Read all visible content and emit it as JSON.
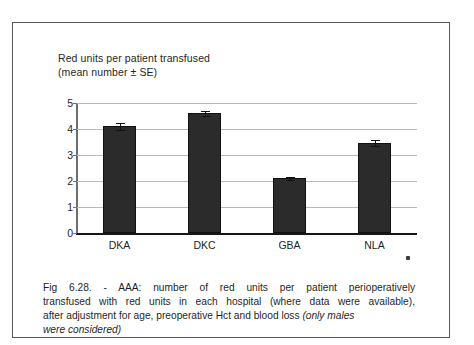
{
  "figure": {
    "title_lines": [
      "Red units per patient transfused",
      "(mean number ± SE)"
    ],
    "caption": {
      "line1": "Fig 6.28. - AAA: number of red units per patient perioperatively",
      "line2": "transfused with red units in each hospital (where data were available),",
      "line3": "after adjustment for age, preoperative Hct and blood loss ",
      "line3_italic": "(only males",
      "line4_italic": "were considered)"
    },
    "colors": {
      "bar_fill": "#2b2b2b",
      "bar_edge": "#111111",
      "gridline": "#b9b9bb",
      "axis": "#161616",
      "frame": "#58585a",
      "text": "#1f1f1f"
    }
  },
  "chart_data": {
    "type": "bar",
    "title": "Red units per patient transfused (mean number ± SE)",
    "xlabel": "",
    "ylabel": "",
    "categories": [
      "DKA",
      "DKC",
      "GBA",
      "NLA"
    ],
    "values": [
      4.1,
      4.6,
      2.1,
      3.47
    ],
    "errors": [
      0.12,
      0.09,
      0.05,
      0.12
    ],
    "yticks": [
      0,
      1,
      2,
      3,
      4,
      5
    ],
    "ytick_labels": [
      "0",
      "1",
      "2",
      "3",
      "4",
      "5"
    ],
    "ylim": [
      0,
      5
    ],
    "grid": true,
    "legend": null,
    "error_type": "SE"
  }
}
